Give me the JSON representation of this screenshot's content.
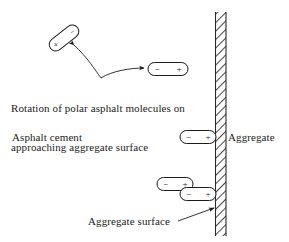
{
  "figure": {
    "background_color": "#ffffff",
    "line_color": "#1c1c1c",
    "width": 289,
    "height": 242
  },
  "labels": {
    "caption_line1": "Rotation of polar asphalt molecules on",
    "caption_line2": "approaching aggregate surface",
    "asphalt_cement": "Asphalt cement",
    "aggregate": "Aggregate",
    "aggregate_surface": "Aggregate surface"
  },
  "wall": {
    "name": "aggregate-hatched-wall",
    "x_left": 215,
    "x_right": 226,
    "y_top": 12,
    "y_bottom": 236,
    "hatch_style": "diagonal",
    "color": "#4a4a4a"
  },
  "molecules": [
    {
      "id": "molecule-rotated",
      "negative_sign": "−",
      "positive_sign": "+",
      "cx": 64,
      "cy": 38,
      "length": 34,
      "thickness": 13,
      "rotation_deg": -38,
      "negative_end": "right",
      "positive_end": "left"
    },
    {
      "id": "molecule-aligned-upper",
      "negative_sign": "−",
      "positive_sign": "+",
      "cx": 168,
      "cy": 69,
      "length": 40,
      "thickness": 13,
      "rotation_deg": 0,
      "negative_end": "left",
      "positive_end": "right"
    },
    {
      "id": "molecule-at-surface-middle",
      "negative_sign": "−",
      "positive_sign": "+",
      "cx": 198,
      "cy": 137,
      "length": 36,
      "thickness": 13,
      "rotation_deg": 0,
      "negative_end": "left",
      "positive_end": "right"
    },
    {
      "id": "molecule-lower-left",
      "negative_sign": "−",
      "positive_sign": "+",
      "cx": 175,
      "cy": 184,
      "length": 36,
      "thickness": 13,
      "rotation_deg": 0,
      "negative_end": "left",
      "positive_end": "right"
    },
    {
      "id": "molecule-at-surface-lower",
      "negative_sign": "−",
      "positive_sign": "+",
      "cx": 198,
      "cy": 194,
      "length": 36,
      "thickness": 13,
      "rotation_deg": 0,
      "negative_end": "left",
      "positive_end": "right"
    }
  ],
  "connectors": {
    "rotation_arrow": {
      "name": "rotation-curved-double-arrow",
      "from": "molecule-rotated",
      "to": "molecule-aligned-upper",
      "arrowheads": "both"
    },
    "surface_leader": {
      "name": "aggregate-surface-leader-line",
      "from": "aggregate-surface-label",
      "to": "wall",
      "arrowheads": "end"
    }
  }
}
